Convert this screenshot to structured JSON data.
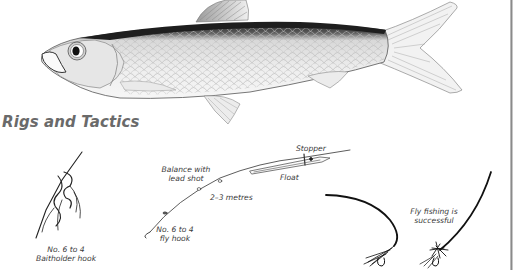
{
  "section": {
    "title": "Rigs and Tactics"
  },
  "illustration": {
    "subject": "fish-illustration"
  },
  "rigs": {
    "baitholder": {
      "line1": "No. 6 to 4",
      "line2": "Baitholder hook"
    },
    "float_rig": {
      "balance_line1": "Balance with",
      "balance_line2": "lead shot",
      "distance": "2–3 metres",
      "stopper": "Stopper",
      "float": "Float",
      "hook_line1": "No. 6 to 4",
      "hook_line2": "fly hook"
    },
    "fly": {
      "line1": "Fly fishing is",
      "line2": "successful"
    }
  },
  "colors": {
    "title": "#6a6a6a",
    "ink": "#1a1a1a",
    "border": "#8a8a8a"
  }
}
